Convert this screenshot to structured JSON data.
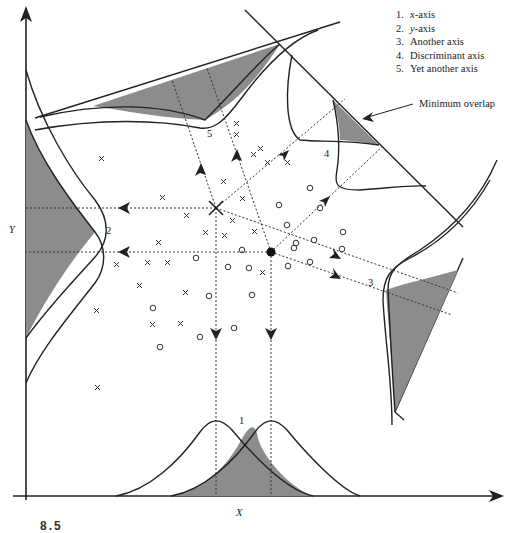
{
  "legend": {
    "items": [
      {
        "num": "1.",
        "label": "x-axis",
        "var": "x",
        "rest": "-axis"
      },
      {
        "num": "2.",
        "label": "y-axis",
        "var": "y",
        "rest": "-axis"
      },
      {
        "num": "3.",
        "label": "Another axis"
      },
      {
        "num": "4.",
        "label": "Discriminant axis"
      },
      {
        "num": "5.",
        "label": "Yet another axis"
      }
    ]
  },
  "annotation": "Minimum overlap",
  "axes": {
    "x_label": "X",
    "y_label": "Y"
  },
  "projection_labels": {
    "p1": "1",
    "p2": "2",
    "p3": "3",
    "p4": "4",
    "p5": "5"
  },
  "caption": "8.5",
  "colors": {
    "ink": "#222222",
    "shade": "#8c8c8c",
    "background": "#ffffff"
  },
  "classes": [
    {
      "name": "class-x",
      "marker": "×",
      "centroid": [
        216,
        208
      ]
    },
    {
      "name": "class-o",
      "marker": "○",
      "centroid": [
        271,
        252
      ]
    }
  ]
}
